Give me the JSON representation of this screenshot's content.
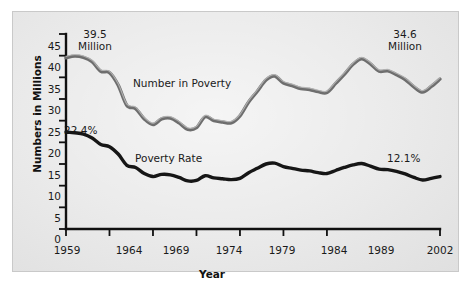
{
  "chart_data": {
    "type": "line",
    "title": "",
    "xlabel": "Year",
    "ylabel": "Numbers in Millions",
    "xlim": [
      1959,
      2002
    ],
    "ylim": [
      0,
      45
    ],
    "grid": false,
    "legend_position": "inline-labels",
    "y_ticks": [
      "45",
      "40",
      "35",
      "30",
      "25",
      "20",
      "15",
      "10",
      "5",
      "0"
    ],
    "y_tick_values": [
      45,
      40,
      35,
      30,
      25,
      20,
      15,
      10,
      5,
      0
    ],
    "x_ticks": [
      "1959",
      "1964",
      "1969",
      "1974",
      "1979",
      "1984",
      "1989",
      "2002"
    ],
    "x_tick_values": [
      1959,
      1964,
      1969,
      1974,
      1979,
      1984,
      1989,
      2002
    ],
    "x": [
      1959,
      1960,
      1961,
      1962,
      1963,
      1964,
      1965,
      1966,
      1967,
      1968,
      1969,
      1970,
      1971,
      1972,
      1973,
      1974,
      1975,
      1976,
      1977,
      1978,
      1979,
      1980,
      1981,
      1982,
      1983,
      1984,
      1985,
      1986,
      1987,
      1988,
      1989,
      1990,
      1991,
      1992,
      1993,
      1994,
      1995,
      1996,
      1997,
      1998,
      1999,
      2000,
      2001,
      2002
    ],
    "series": [
      {
        "name": "Number in Poverty",
        "unit": "millions",
        "color": "#6e6e6e",
        "values": [
          39.5,
          39.9,
          39.6,
          38.6,
          36.4,
          36.1,
          33.2,
          28.5,
          27.8,
          25.4,
          24.1,
          25.4,
          25.6,
          24.5,
          23.0,
          23.4,
          25.9,
          25.0,
          24.7,
          24.5,
          26.1,
          29.3,
          31.8,
          34.4,
          35.3,
          33.7,
          33.1,
          32.4,
          32.2,
          31.7,
          31.5,
          33.6,
          35.7,
          38.0,
          39.3,
          38.1,
          36.4,
          36.5,
          35.6,
          34.5,
          32.8,
          31.6,
          32.9,
          34.6
        ]
      },
      {
        "name": "Poverty Rate",
        "unit": "percent",
        "color": "#161616",
        "values": [
          22.4,
          22.2,
          21.9,
          21.0,
          19.5,
          19.0,
          17.3,
          14.7,
          14.2,
          12.8,
          12.1,
          12.6,
          12.5,
          11.9,
          11.1,
          11.2,
          12.3,
          11.8,
          11.6,
          11.4,
          11.7,
          13.0,
          14.0,
          15.0,
          15.2,
          14.4,
          14.0,
          13.6,
          13.4,
          13.0,
          12.8,
          13.5,
          14.2,
          14.8,
          15.1,
          14.5,
          13.8,
          13.7,
          13.3,
          12.7,
          11.9,
          11.3,
          11.7,
          12.1
        ]
      }
    ],
    "annotations": [
      {
        "id": "start-number",
        "text_line1": "39.5",
        "text_line2": "Million",
        "at_year": 1959,
        "value": 39.5
      },
      {
        "id": "end-number",
        "text_line1": "34.6",
        "text_line2": "Million",
        "at_year": 2002,
        "value": 34.6
      },
      {
        "id": "start-rate",
        "text_line1": "22.4%",
        "text_line2": "",
        "at_year": 1959,
        "value": 22.4
      },
      {
        "id": "end-rate",
        "text_line1": "12.1%",
        "text_line2": "",
        "at_year": 2002,
        "value": 12.1
      }
    ],
    "series_inline_labels": [
      {
        "id": "upper",
        "text": "Number in Poverty"
      },
      {
        "id": "lower",
        "text": "Poverty Rate"
      }
    ]
  }
}
